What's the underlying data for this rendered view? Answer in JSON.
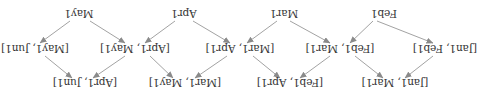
{
  "diagram": {
    "orientation_deg": 180,
    "colors": {
      "text": "#333333",
      "edge": "#8a8a8a",
      "background": "#ffffff"
    },
    "rows": {
      "points": [
        {
          "id": "feb1",
          "label": "Feb1"
        },
        {
          "id": "mar1",
          "label": "Mar1"
        },
        {
          "id": "apr1",
          "label": "Apr1"
        },
        {
          "id": "may1",
          "label": "May1"
        }
      ],
      "pairs": [
        {
          "id": "jan1_feb1",
          "label": "[Jan1, Feb1]"
        },
        {
          "id": "feb1_mar1",
          "label": "[Feb1, Mar1]"
        },
        {
          "id": "mar1_apr1",
          "label": "[Mar1, Apr1]"
        },
        {
          "id": "apr1_may1",
          "label": "[Apr1, May1]"
        },
        {
          "id": "may1_jun1",
          "label": "[May1, Jun1]"
        }
      ],
      "spans": [
        {
          "id": "jan1_mar1",
          "label": "[Jan1, Mar1]"
        },
        {
          "id": "feb1_apr1",
          "label": "[Feb1, Apr1]"
        },
        {
          "id": "mar1_may1",
          "label": "[Mar1, May1]"
        },
        {
          "id": "apr1_jun1",
          "label": "[Apr1, Jun1]"
        }
      ]
    },
    "edges": [
      {
        "from": "feb1",
        "to": "jan1_feb1"
      },
      {
        "from": "feb1",
        "to": "feb1_mar1"
      },
      {
        "from": "mar1",
        "to": "feb1_mar1"
      },
      {
        "from": "mar1",
        "to": "mar1_apr1"
      },
      {
        "from": "apr1",
        "to": "mar1_apr1"
      },
      {
        "from": "apr1",
        "to": "apr1_may1"
      },
      {
        "from": "may1",
        "to": "apr1_may1"
      },
      {
        "from": "may1",
        "to": "may1_jun1"
      },
      {
        "from": "jan1_feb1",
        "to": "jan1_mar1"
      },
      {
        "from": "feb1_mar1",
        "to": "jan1_mar1"
      },
      {
        "from": "feb1_mar1",
        "to": "feb1_apr1"
      },
      {
        "from": "mar1_apr1",
        "to": "feb1_apr1"
      },
      {
        "from": "mar1_apr1",
        "to": "mar1_may1"
      },
      {
        "from": "apr1_may1",
        "to": "mar1_may1"
      },
      {
        "from": "apr1_may1",
        "to": "apr1_jun1"
      },
      {
        "from": "may1_jun1",
        "to": "apr1_jun1"
      }
    ]
  }
}
